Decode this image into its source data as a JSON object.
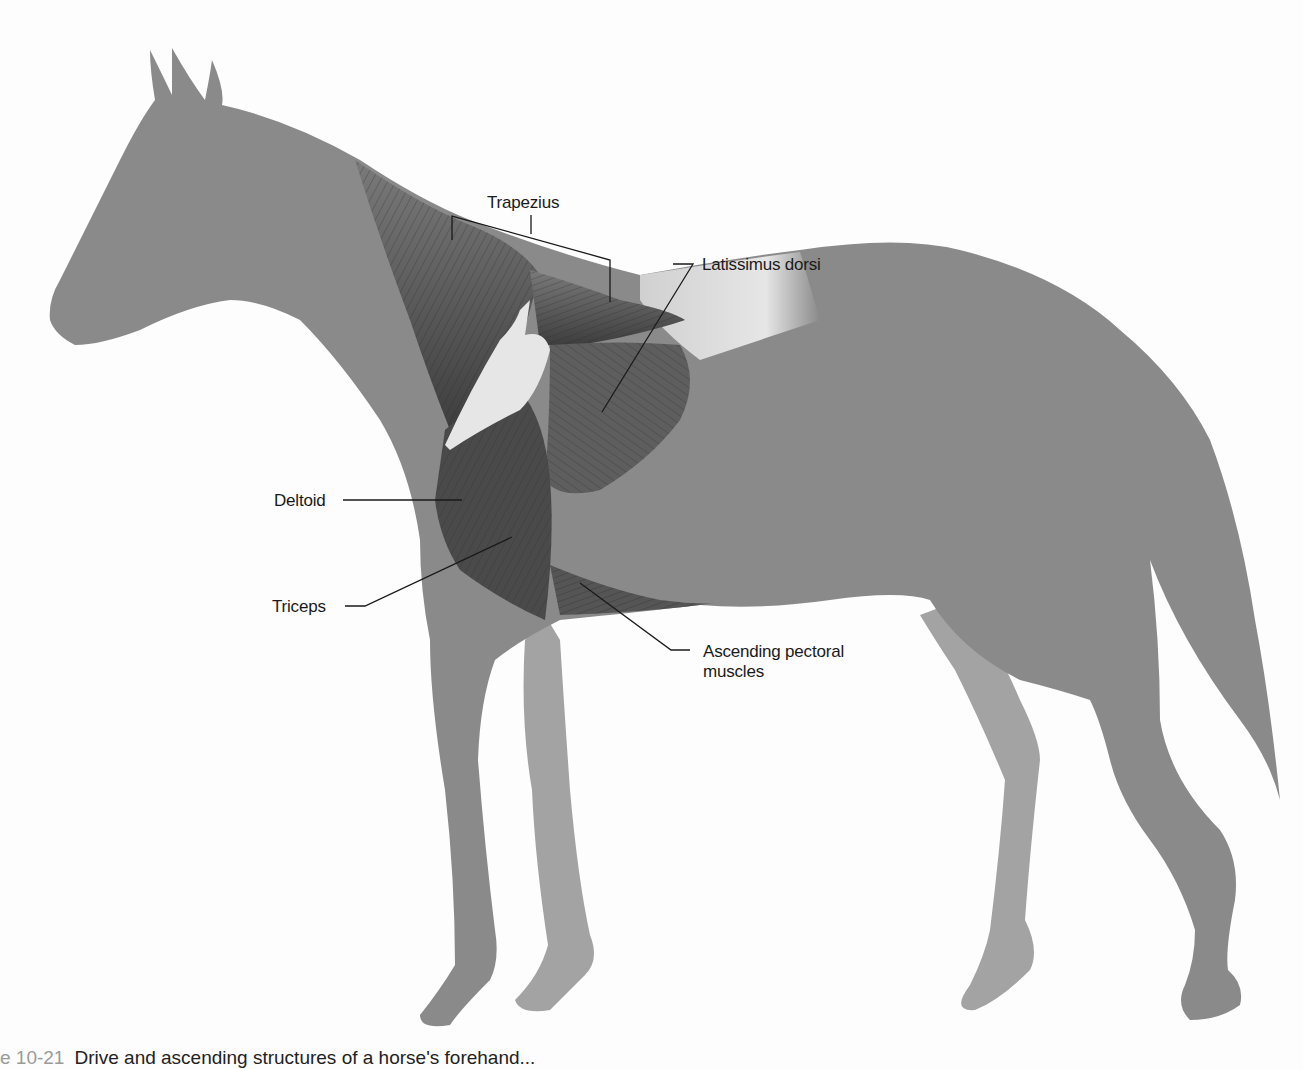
{
  "figure": {
    "subject": "horse",
    "colors": {
      "background": "#fdfdfd",
      "body_near": "#8a8a8a",
      "legs_far": "#a3a3a3",
      "muscle_dark": "#4a4a4a",
      "muscle_mid": "#6e6e6e",
      "bone_pale": "#e6e6e6",
      "leader_line": "#1a1a1a"
    },
    "labels": [
      {
        "id": "trapezius",
        "text": "Trapezius"
      },
      {
        "id": "latissimus",
        "text": "Latissimus dorsi"
      },
      {
        "id": "deltoid",
        "text": "Deltoid"
      },
      {
        "id": "triceps",
        "text": "Triceps"
      },
      {
        "id": "pectoral_line1",
        "text": "Ascending pectoral"
      },
      {
        "id": "pectoral_line2",
        "text": "muscles"
      }
    ]
  },
  "caption": {
    "number": "e 10-21",
    "text": "Drive and ascending structures of a horse's forehand..."
  }
}
